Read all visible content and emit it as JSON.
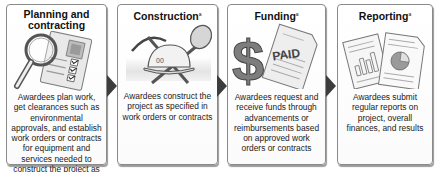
{
  "diagram": {
    "type": "process-flow",
    "steps": [
      {
        "title": "Planning and contracting",
        "title_line1": "Planning and",
        "title_line2": "contracting",
        "footnote": "",
        "icon": "checklist-magnifier-icon",
        "description": "Awardees plan work, get clearances such as environmental approvals, and establish work orders or contracts for equipment and services needed to construct the project as approved"
      },
      {
        "title": "Construction",
        "footnote": "a",
        "icon": "hardhat-pickaxe-shovel-icon",
        "description": "Awardees construct the project as specified in work orders or contracts"
      },
      {
        "title": "Funding",
        "footnote": "a",
        "icon": "dollar-paid-invoice-icon",
        "icon_text": "PAID",
        "description": "Awardees request and receive funds through advancements or reimbursements based on approved work orders or contracts"
      },
      {
        "title": "Reporting",
        "footnote": "a",
        "icon": "reports-charts-icon",
        "description": "Awardees submit regular reports on project, overall finances, and results"
      }
    ],
    "connectors": [
      "arrow-right",
      "arrow-right",
      "arrow-right"
    ],
    "colors": {
      "box_border": "#8a8a8a",
      "arrow": "#3d3d3d",
      "text": "#222222"
    }
  }
}
